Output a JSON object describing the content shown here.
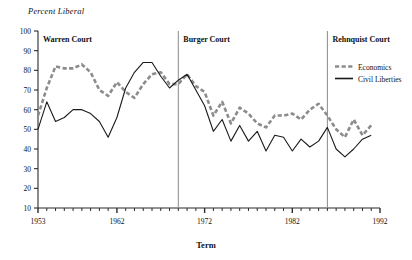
{
  "chart_data": {
    "type": "line",
    "title": "",
    "ylabel": "Percent Liberal",
    "xlabel": "Term",
    "ylim": [
      10,
      100
    ],
    "ytick_values": [
      10,
      20,
      30,
      40,
      50,
      60,
      70,
      80,
      90,
      100
    ],
    "ytick_labels": [
      "10",
      "20",
      "30",
      "40",
      "50",
      "60",
      "70",
      "80",
      "90",
      "100"
    ],
    "xlim": [
      1953,
      1992
    ],
    "xtick_values": [
      1953,
      1962,
      1972,
      1982,
      1992
    ],
    "xtick_labels": [
      "1953",
      "1962",
      "1972",
      "1982",
      "1992"
    ],
    "grid": false,
    "legend_position": "top-right",
    "x": [
      1953,
      1954,
      1955,
      1956,
      1957,
      1958,
      1959,
      1960,
      1961,
      1962,
      1963,
      1964,
      1965,
      1966,
      1967,
      1968,
      1969,
      1970,
      1971,
      1972,
      1973,
      1974,
      1975,
      1976,
      1977,
      1978,
      1979,
      1980,
      1981,
      1982,
      1983,
      1984,
      1985,
      1986,
      1987,
      1988,
      1989,
      1990,
      1991
    ],
    "series": [
      {
        "name": "Economics",
        "color": "#8c8c8c",
        "style": "dashed",
        "values": [
          57,
          71,
          82,
          81,
          81,
          83,
          79,
          70,
          67,
          74,
          69,
          66,
          73,
          78,
          79,
          73,
          73,
          78,
          72,
          69,
          57,
          64,
          53,
          61,
          58,
          53,
          51,
          57,
          57,
          58,
          55,
          60,
          63,
          57,
          50,
          46,
          55,
          47,
          52
        ]
      },
      {
        "name": "Civil Liberties",
        "color": "#1a1a1a",
        "style": "solid",
        "values": [
          50,
          64,
          54,
          56,
          60,
          60,
          58,
          54,
          46,
          56,
          71,
          79,
          84,
          84,
          77,
          71,
          75,
          78,
          70,
          62,
          49,
          55,
          44,
          52,
          44,
          49,
          39,
          47,
          46,
          39,
          45,
          41,
          44,
          51,
          40,
          36,
          40,
          45,
          47
        ]
      }
    ],
    "eras": [
      {
        "label": "Warren Court",
        "start": 1953,
        "end": 1969
      },
      {
        "label": "Burger Court",
        "start": 1969,
        "end": 1986
      },
      {
        "label": "Rehnquist Court",
        "start": 1986,
        "end": 1992
      }
    ],
    "era_dividers": [
      1969,
      1986
    ]
  },
  "legend": {
    "items": [
      {
        "label": "Economics"
      },
      {
        "label": "Civil Liberties"
      }
    ]
  }
}
